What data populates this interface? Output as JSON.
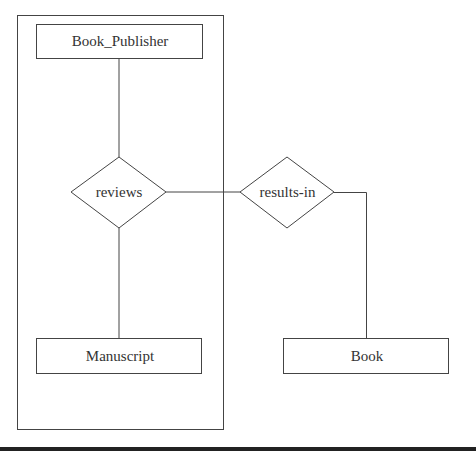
{
  "diagram": {
    "type": "ER diagram with aggregation",
    "aggregation_box": {
      "label": ""
    },
    "entities": [
      {
        "id": "book_publisher",
        "label": "Book_Publisher"
      },
      {
        "id": "manuscript",
        "label": "Manuscript"
      },
      {
        "id": "book",
        "label": "Book"
      }
    ],
    "relationships": [
      {
        "id": "reviews",
        "label": "reviews",
        "connects": [
          "book_publisher",
          "manuscript"
        ]
      },
      {
        "id": "results_in",
        "label": "results-in",
        "connects": [
          "aggregation",
          "book"
        ]
      }
    ],
    "colors": {
      "stroke": "#444444",
      "text": "#333333",
      "background": "#ffffff",
      "bar": "#222222"
    }
  }
}
